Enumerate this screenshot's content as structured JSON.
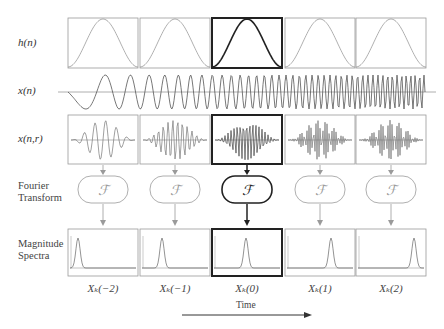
{
  "row_labels": {
    "window": "h(n)",
    "signal": "x(n)",
    "segment": "x(n,r)",
    "fourier": [
      "Fourier",
      "Transform"
    ],
    "magnitude": [
      "Magnitude",
      "Spectra"
    ]
  },
  "transform_symbol": "ℱ",
  "columns": [
    {
      "index": -2,
      "caption": "Xₖ(−2)",
      "highlight": false
    },
    {
      "index": -1,
      "caption": "Xₖ(−1)",
      "highlight": false
    },
    {
      "index": 0,
      "caption": "Xₖ(0)",
      "highlight": true
    },
    {
      "index": 1,
      "caption": "Xₖ(1)",
      "highlight": false
    },
    {
      "index": 2,
      "caption": "Xₖ(2)",
      "highlight": false
    }
  ],
  "time_axis": {
    "label": "Time"
  },
  "colors": {
    "normal": "#9a9a9a",
    "highlight": "#222222",
    "signal": "#555555"
  }
}
